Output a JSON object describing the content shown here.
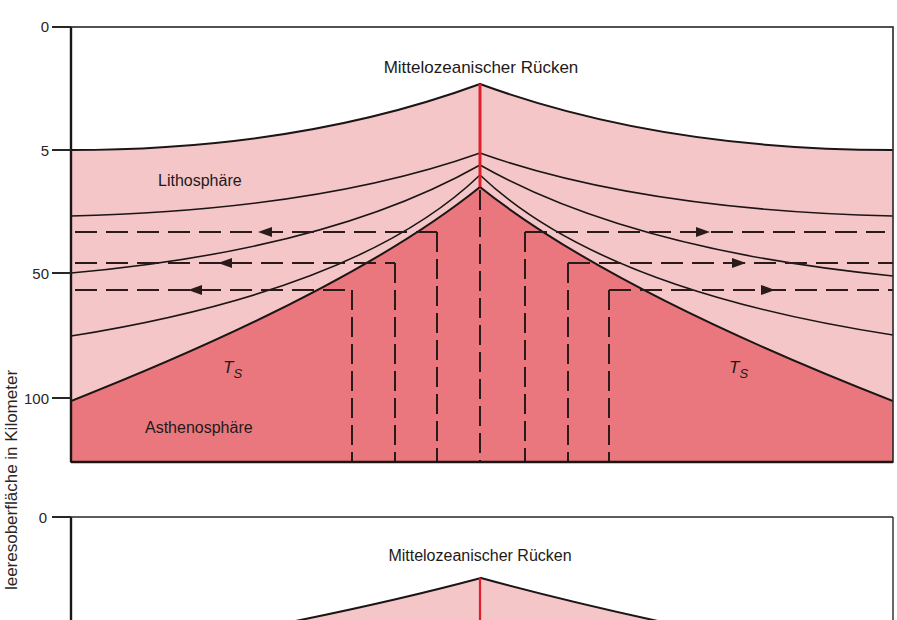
{
  "axis": {
    "ylabel": "Tiefe unter der Meeresoberfläche in Kilometer",
    "ylabel_visible": "leeresoberfläche in Kilometer",
    "top_ticks": [
      "0",
      "5",
      "50",
      "100"
    ],
    "bottom_ticks": [
      "0"
    ]
  },
  "top_panel": {
    "ridge_label": "Mittelozeanischer Rücken",
    "lithosphere_label": "Lithosphäre",
    "asthenosphere_label": "Asthenosphäre",
    "ts_left": "T",
    "ts_left_sub": "S",
    "ts_right": "T",
    "ts_right_sub": "S"
  },
  "bottom_panel": {
    "ridge_label": "Mittelozeanischer Rücken"
  },
  "colors": {
    "lithosphere": "#f4c6c8",
    "asthenosphere": "#e9777d",
    "ridge_axis": "#e01e2a",
    "line": "#1c1515"
  }
}
